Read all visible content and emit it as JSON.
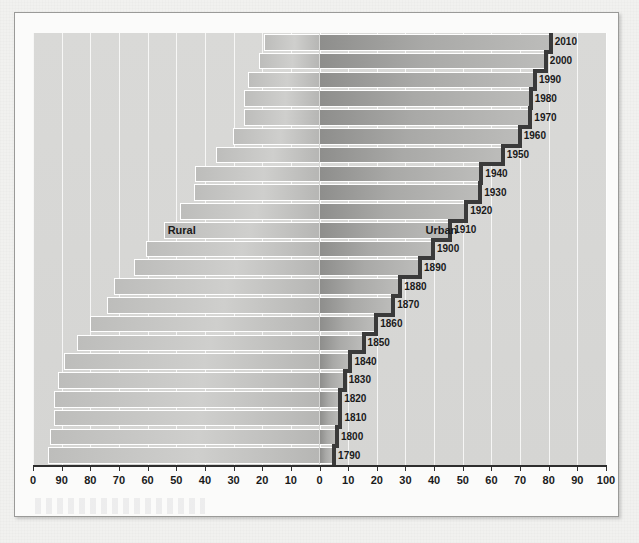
{
  "figure": {
    "region_labels": {
      "rural": "Rural",
      "urban": "Urban"
    }
  },
  "chart_data": {
    "type": "bar",
    "title": "",
    "subtitle": "",
    "xlabel": "",
    "ylabel": "",
    "orientation": "horizontal-diverging",
    "grid": true,
    "legend_position": "inline-annotation",
    "annotations": [
      "Rural",
      "Urban"
    ],
    "axis": {
      "left_side_label": "Rural",
      "right_side_label": "Urban",
      "left_ticks": [
        "0",
        "90",
        "80",
        "70",
        "60",
        "50",
        "40",
        "30",
        "20",
        "10",
        "0"
      ],
      "right_ticks": [
        "0",
        "10",
        "20",
        "30",
        "40",
        "50",
        "60",
        "70",
        "80",
        "90",
        "100"
      ],
      "xlim_left": [
        100,
        0
      ],
      "xlim_right": [
        0,
        100
      ],
      "tick_step": 10,
      "units": "percent"
    },
    "categories": [
      "1790",
      "1800",
      "1810",
      "1820",
      "1830",
      "1840",
      "1850",
      "1860",
      "1870",
      "1880",
      "1890",
      "1900",
      "1910",
      "1920",
      "1930",
      "1940",
      "1950",
      "1960",
      "1970",
      "1980",
      "1990",
      "2000",
      "2010"
    ],
    "series": [
      {
        "name": "Urban",
        "values": [
          5.1,
          6.1,
          7.3,
          7.2,
          8.8,
          10.8,
          15.4,
          19.8,
          25.7,
          28.2,
          35.1,
          39.6,
          45.6,
          51.2,
          56.1,
          56.5,
          64.0,
          69.9,
          73.6,
          73.7,
          75.2,
          79.0,
          80.7
        ]
      },
      {
        "name": "Rural",
        "values": [
          94.9,
          93.9,
          92.7,
          92.8,
          91.2,
          89.2,
          84.6,
          80.2,
          74.3,
          71.8,
          64.9,
          60.4,
          54.4,
          48.8,
          43.9,
          43.5,
          36.0,
          30.1,
          26.4,
          26.3,
          24.8,
          21.0,
          19.3
        ]
      }
    ]
  }
}
